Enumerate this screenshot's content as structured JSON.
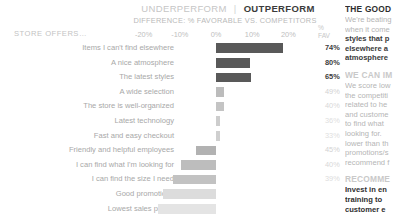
{
  "header": {
    "underperform": "UNDERPERFORM",
    "separator": "|",
    "outperform": "OUTPERFORM",
    "subtitle": "DIFFERENCE: % FAVORABLE VS. COMPETITORS",
    "category_header": "STORE OFFERS…",
    "fav_header_line1": "%",
    "fav_header_line2": "FAV"
  },
  "chart_data": {
    "type": "bar",
    "title": "DIFFERENCE: % FAVORABLE VS. COMPETITORS",
    "orientation": "horizontal",
    "xlabel": "",
    "ylabel": "STORE OFFERS…",
    "xlim": [
      -20,
      20
    ],
    "xticks": [
      -20,
      -10,
      0,
      10,
      20
    ],
    "xtick_labels": [
      "-20%",
      "-10%",
      "0%",
      "10%",
      "20%"
    ],
    "grid": false,
    "legend": "none",
    "categories": [
      "Items I can't find elsewhere",
      "A nice atmosphere",
      "The latest styles",
      "A wide selection",
      "The store is well-organized",
      "Latest technology",
      "Fast and easy checkout",
      "Friendly and helpful employees",
      "I can find what I'm looking for",
      "I can find the size I need",
      "Good promotions",
      "Lowest sales prices"
    ],
    "values": [
      18.5,
      9.5,
      9.7,
      2.1,
      2.1,
      1.0,
      1.0,
      -5.4,
      -9.7,
      -12.0,
      -14.6,
      -16.0
    ],
    "pct_favorable": [
      "74%",
      "80%",
      "65%",
      "49%",
      "40%",
      "36%",
      "33%",
      "45%",
      "40%",
      "39%",
      "",
      ""
    ],
    "bar_colors": [
      "#595959",
      "#595959",
      "#595959",
      "#bcbcbc",
      "#c4c4c4",
      "#cdcdcd",
      "#cfcfcf",
      "#b2b2b2",
      "#bdbdbd",
      "#c2c2c2",
      "#dcdcdc",
      "#e4e4e4"
    ],
    "fav_colors": [
      "#3c3c3c",
      "#3c3c3c",
      "#3c3c3c",
      "#d2d2d2",
      "#d8d8d8",
      "#dedede",
      "#dedede",
      "#d2d2d2",
      "#d8d8d8",
      "#dcdcdc",
      "#ececec",
      "#f0f0f0"
    ]
  },
  "side": {
    "good_heading": "THE GOOD",
    "good_text_1": "We're beating",
    "good_text_2": "when it come",
    "good_bold_1": "styles that p",
    "good_bold_2": "elsewhere a",
    "good_bold_3": "atmosphere",
    "improve_heading": "WE CAN IM",
    "improve_text_1": "We score low",
    "improve_text_2": "the competiti",
    "improve_text_3": "related to he",
    "improve_text_4": "and custome",
    "improve_text_5": "to find what",
    "improve_text_6": "looking for.",
    "improve_text_7": "lower than th",
    "improve_text_8": "promotions/s",
    "improve_text_9": "recommend f",
    "rec_heading": "RECOMME",
    "rec_bold_1": "Invest in en",
    "rec_bold_2": "training to",
    "rec_bold_3": "customer e"
  }
}
